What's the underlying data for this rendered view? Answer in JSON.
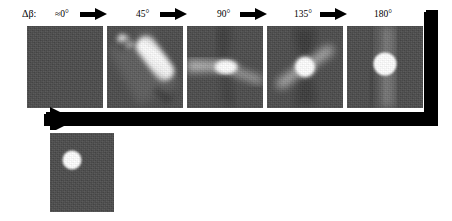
{
  "figure": {
    "parameter_label": "Δβ:",
    "background_gray": "#4a4a4a",
    "arrow_color": "#000000",
    "row1": {
      "panels": [
        {
          "angle_label": "≈0°",
          "feature": "uniform-noise-no-signal"
        },
        {
          "angle_label": "45°",
          "feature": "diagonal-bright-streak"
        },
        {
          "angle_label": "90°",
          "feature": "horizontal-bright-lobe-dark-cross"
        },
        {
          "angle_label": "135°",
          "feature": "bright-core-diagonal-streaks"
        },
        {
          "angle_label": "180°",
          "feature": "bright-disk-vertical-halo"
        }
      ],
      "step_arrows": 4
    },
    "row2": {
      "caption": "225° (=180° + Full fan angle)",
      "panel": {
        "feature": "bright-disk-upper-left"
      }
    }
  }
}
